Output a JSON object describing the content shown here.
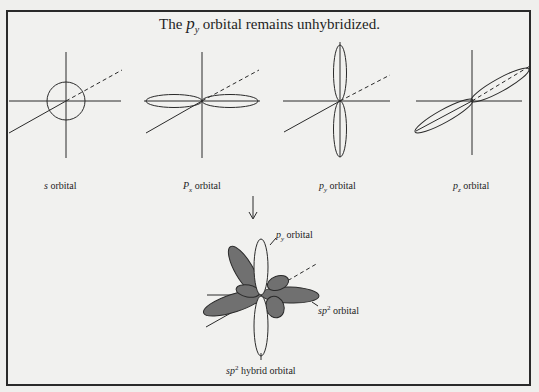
{
  "title": {
    "prefix": "The",
    "orbital_symbol": "p",
    "orbital_subscript": "y",
    "suffix": "orbital remains unhybridized."
  },
  "panels": [
    {
      "id": "s",
      "label_symbol": "s",
      "label_subscript": "",
      "label_text": "orbital"
    },
    {
      "id": "px",
      "label_symbol": "P",
      "label_subscript": "x",
      "label_text": "orbital"
    },
    {
      "id": "py",
      "label_symbol": "p",
      "label_subscript": "y",
      "label_text": "orbital"
    },
    {
      "id": "pz",
      "label_symbol": "p",
      "label_subscript": "z",
      "label_text": "orbital"
    }
  ],
  "arrow": {
    "direction": "down"
  },
  "hybrid": {
    "py_label_symbol": "p",
    "py_label_subscript": "y",
    "py_label_text": "orbital",
    "sp2_label_symbol": "sp",
    "sp2_label_superscript": "2",
    "sp2_label_text": "orbital",
    "caption_symbol": "sp",
    "caption_superscript": "2",
    "caption_text": "hybrid orbital"
  },
  "colors": {
    "line": "#2a2a2a",
    "hybrid_fill": "#707070",
    "background": "#f1f1ef"
  }
}
